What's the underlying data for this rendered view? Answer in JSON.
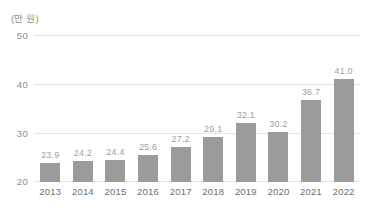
{
  "chart_data": {
    "type": "bar",
    "title": "",
    "subtitle": "",
    "unit_label": "(만 원)",
    "xlabel": "",
    "ylabel": "",
    "categories": [
      "2013",
      "2014",
      "2015",
      "2016",
      "2017",
      "2018",
      "2019",
      "2020",
      "2021",
      "2022"
    ],
    "values": [
      23.9,
      24.2,
      24.4,
      25.6,
      27.2,
      29.1,
      32.1,
      30.2,
      36.7,
      41.0
    ],
    "value_labels": [
      "23.9",
      "24.2",
      "24.4",
      "25.6",
      "27.2",
      "29.1",
      "32.1",
      "30.2",
      "36.7",
      "41.0"
    ],
    "ylim": [
      20,
      50
    ],
    "yticks": [
      50,
      40,
      30,
      20
    ],
    "ytick_labels": [
      "50",
      "40",
      "30",
      "20"
    ],
    "grid": true,
    "grid_axis": "y",
    "legend": "none",
    "colors": {
      "bar": "#9b9b9b",
      "grid": "#e3e3e3",
      "value_label": "#a0a0a0",
      "tick_label": "#8c8c8c",
      "category_label": "#6e6e6e",
      "background": "#ffffff"
    }
  }
}
